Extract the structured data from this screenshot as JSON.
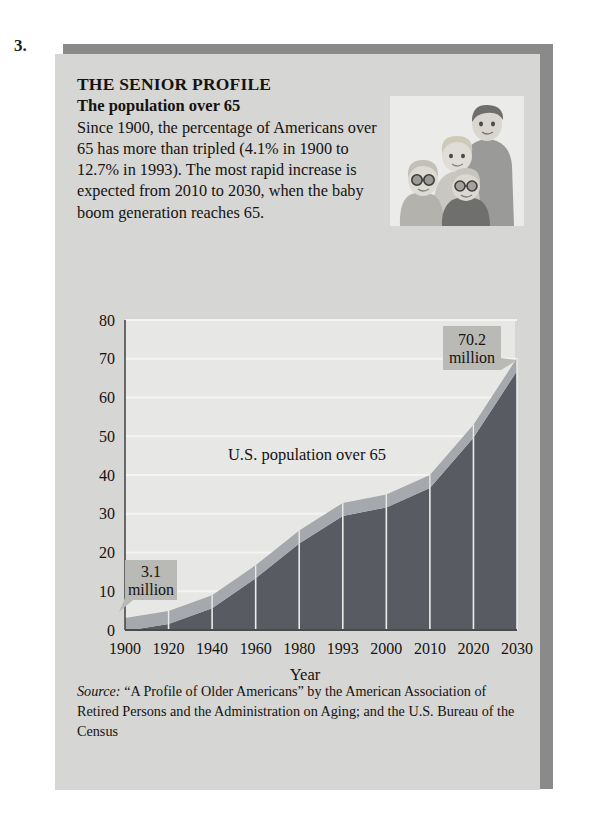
{
  "exercise_number": "3.",
  "panel": {
    "headline": "THE SENIOR PROFILE",
    "subhead": "The population over 65",
    "body": "Since 1900, the percentage of Americans over 65 has more than tripled (4.1% in 1900 to 12.7% in 1993). The most rapid increase is expected from 2010 to 2030, when the baby boom generation reaches 65.",
    "photo_alt": "four-older-adults-photo"
  },
  "source": {
    "label": "Source:",
    "text": " “A Profile of Older Americans” by the American Association of Retired Persons and the Administration on Aging; and the U.S. Bureau of the Census"
  },
  "chart_data": {
    "type": "area",
    "title": "",
    "series_label": "U.S. population over 65",
    "xlabel": "Year",
    "ylabel": "",
    "categories": [
      "1900",
      "1920",
      "1940",
      "1960",
      "1980",
      "1993",
      "2000",
      "2010",
      "2020",
      "2030"
    ],
    "values": [
      3.1,
      4.9,
      9.0,
      16.7,
      25.7,
      32.8,
      35.0,
      40.0,
      53.0,
      70.2
    ],
    "ylim": [
      0,
      80
    ],
    "yticks": [
      "0",
      "10",
      "20",
      "30",
      "40",
      "50",
      "60",
      "70",
      "80"
    ],
    "grid": true,
    "legend": "none",
    "units": "millions",
    "annotations": [
      {
        "name": "first-point-callout",
        "line1": "3.1",
        "line2": "million",
        "points_to": "1900"
      },
      {
        "name": "last-point-callout",
        "line1": "70.2",
        "line2": "million",
        "points_to": "2030"
      }
    ],
    "colors": {
      "area_front": "#585c62",
      "area_top": "#a5a8ac",
      "plot_background": "#e6e6e4",
      "gridline": "#f4f4f2",
      "axis": "#4a4a4a",
      "callout_fill": "#b9b9b6",
      "panel": "#d6d6d4",
      "shadow": "#8a8a8a"
    }
  }
}
